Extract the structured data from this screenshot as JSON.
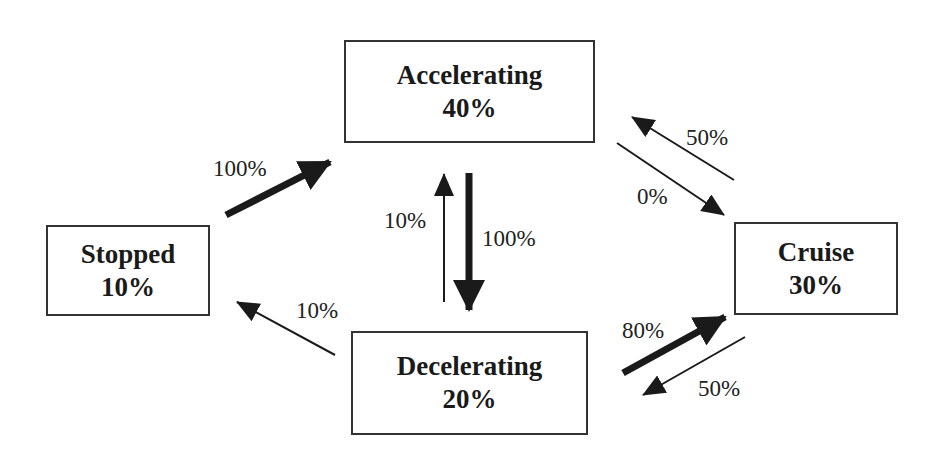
{
  "diagram": {
    "type": "state-transition",
    "nodes": [
      {
        "id": "accelerating",
        "name": "Accelerating",
        "share": "40%"
      },
      {
        "id": "stopped",
        "name": "Stopped",
        "share": "10%"
      },
      {
        "id": "cruise",
        "name": "Cruise",
        "share": "30%"
      },
      {
        "id": "decelerating",
        "name": "Decelerating",
        "share": "20%"
      }
    ],
    "edges": [
      {
        "from": "stopped",
        "to": "accelerating",
        "label": "100%",
        "weight": "thick"
      },
      {
        "from": "decelerating",
        "to": "stopped",
        "label": "10%",
        "weight": "thin"
      },
      {
        "from": "decelerating",
        "to": "accelerating",
        "label": "10%",
        "weight": "thin"
      },
      {
        "from": "accelerating",
        "to": "decelerating",
        "label": "100%",
        "weight": "thick"
      },
      {
        "from": "cruise",
        "to": "accelerating",
        "label": "50%",
        "weight": "thin"
      },
      {
        "from": "accelerating",
        "to": "cruise",
        "label": "0%",
        "weight": "thin"
      },
      {
        "from": "decelerating",
        "to": "cruise",
        "label": "80%",
        "weight": "thick"
      },
      {
        "from": "cruise",
        "to": "decelerating",
        "label": "50%",
        "weight": "thin"
      }
    ]
  }
}
